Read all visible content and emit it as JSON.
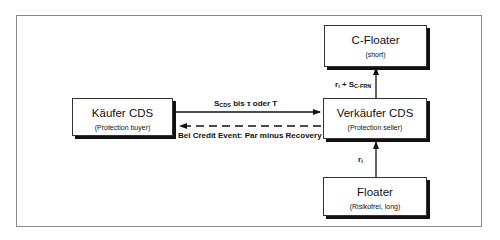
{
  "diagram": {
    "nodes": [
      {
        "id": "buyer",
        "title": "Käufer CDS",
        "subtitle": "(Protection buyer)"
      },
      {
        "id": "seller",
        "title": "Verkäufer CDS",
        "subtitle": "(Protection seller)"
      },
      {
        "id": "cfloater",
        "title": "C-Floater",
        "subtitle": "(short)"
      },
      {
        "id": "floater",
        "title": "Floater",
        "subtitle": "(Risikofrei, long)"
      }
    ],
    "edges": [
      {
        "from": "buyer",
        "to": "seller",
        "style": "solid",
        "label_main": "S",
        "label_sub": "CDS",
        "label_rest": " bis τ oder T"
      },
      {
        "from": "seller",
        "to": "buyer",
        "style": "dashed",
        "label": "Bei Credit Event: Par minus Recovery"
      },
      {
        "from": "seller",
        "to": "cfloater",
        "style": "solid",
        "label_r": "r",
        "label_r_sub": "i",
        "label_plus": " + S",
        "label_sub": "C-FRN"
      },
      {
        "from": "floater",
        "to": "seller",
        "style": "solid",
        "label_r": "r",
        "label_r_sub": "i"
      }
    ]
  }
}
